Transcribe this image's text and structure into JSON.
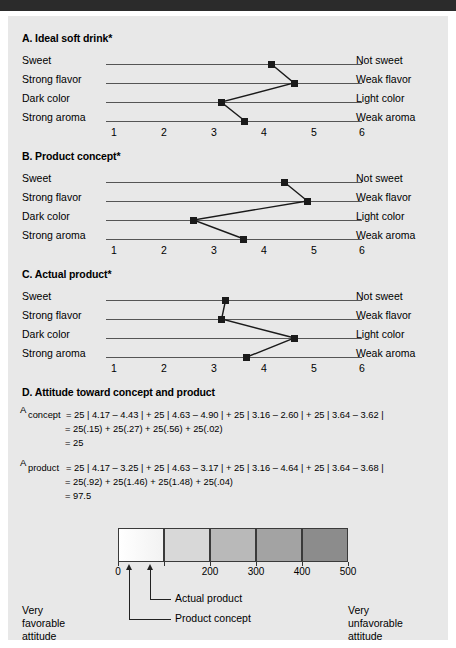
{
  "document": {
    "background_color": "#e8e8e8",
    "topbar_color": "#2b2b2b"
  },
  "panels": [
    {
      "id": "A",
      "title": "A. Ideal soft drink*",
      "left_labels": [
        "Sweet",
        "Strong flavor",
        "Dark color",
        "Strong aroma"
      ],
      "right_labels": [
        "Not sweet",
        "Weak flavor",
        "Light color",
        "Weak aroma"
      ],
      "ticks": [
        "1",
        "2",
        "3",
        "4",
        "5",
        "6"
      ],
      "values": [
        4.17,
        4.63,
        3.16,
        3.64
      ]
    },
    {
      "id": "B",
      "title": "B. Product concept*",
      "left_labels": [
        "Sweet",
        "Strong flavor",
        "Dark color",
        "Strong aroma"
      ],
      "right_labels": [
        "Not sweet",
        "Weak flavor",
        "Light color",
        "Weak aroma"
      ],
      "ticks": [
        "1",
        "2",
        "3",
        "4",
        "5",
        "6"
      ],
      "values": [
        4.43,
        4.9,
        2.6,
        3.62
      ]
    },
    {
      "id": "C",
      "title": "C. Actual product*",
      "left_labels": [
        "Sweet",
        "Strong flavor",
        "Dark color",
        "Strong aroma"
      ],
      "right_labels": [
        "Not sweet",
        "Weak flavor",
        "Light color",
        "Weak aroma"
      ],
      "ticks": [
        "1",
        "2",
        "3",
        "4",
        "5",
        "6"
      ],
      "values": [
        3.25,
        3.17,
        4.64,
        3.68
      ]
    }
  ],
  "section_d": {
    "title": "D. Attitude toward concept and product",
    "concept": {
      "symbol": "A",
      "subscript": "concept",
      "line1": "= 25 | 4.17 – 4.43 | + 25 | 4.63 – 4.90 | + 25 | 3.16 – 2.60 | + 25 | 3.64 – 3.62 |",
      "line2": "= 25(.15) + 25(.27) + 25(.56) + 25(.02)",
      "line3": "= 25"
    },
    "product": {
      "symbol": "A",
      "subscript": "product",
      "line1": "= 25 | 4.17 – 3.25 | + 25 | 4.63 – 3.17 | + 25 | 3.16 – 4.64 | + 25 | 3.64 – 3.68 |",
      "line2": "= 25(.92) + 25(1.46) + 25(1.48) + 25(.04)",
      "line3": "= 97.5"
    }
  },
  "scale": {
    "ticks": [
      "0",
      "100",
      "200",
      "300",
      "400",
      "500"
    ],
    "visible_ticks": [
      "0",
      "200",
      "300",
      "400",
      "500"
    ],
    "segment_colors": [
      "#fbfbfb",
      "#d8d8d8",
      "#b9b9b9",
      "#a3a3a3",
      "#8c8c8c"
    ],
    "markers": [
      {
        "name": "Product concept",
        "value": 25
      },
      {
        "name": "Actual product",
        "value": 97.5
      }
    ],
    "left_label": "Very\nfavorable\nattitude",
    "left_label_lines": [
      "Very",
      "favorable",
      "attitude"
    ],
    "right_label_lines": [
      "Very",
      "unfavorable",
      "attitude"
    ]
  },
  "chart_data": {
    "type": "line",
    "xlabel": "",
    "ylabel": "",
    "xlim": [
      1,
      6
    ],
    "grid": false,
    "legend_position": "none",
    "categories": [
      "Sweet / Not sweet",
      "Strong flavor / Weak flavor",
      "Dark color / Light color",
      "Strong aroma / Weak aroma"
    ],
    "tick_labels": [
      "1",
      "2",
      "3",
      "4",
      "5",
      "6"
    ],
    "series": [
      {
        "name": "A. Ideal soft drink",
        "values": [
          4.17,
          4.63,
          3.16,
          3.64
        ]
      },
      {
        "name": "B. Product concept",
        "values": [
          4.43,
          4.9,
          2.6,
          3.62
        ]
      },
      {
        "name": "C. Actual product",
        "values": [
          3.25,
          3.17,
          4.64,
          3.68
        ]
      }
    ],
    "attitude_scores": {
      "A_concept": 25,
      "A_product": 97.5
    },
    "attitude_scale_range": [
      0,
      500
    ]
  }
}
